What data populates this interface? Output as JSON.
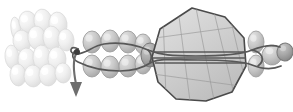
{
  "figure": {
    "domain": "Diagram",
    "caption": "",
    "width": 293,
    "height": 112,
    "background_color": "#ffffff",
    "style": {
      "rendering": "grayscale shaded 3D illustration",
      "outline_color": "#4a4a4a",
      "strand_color": "#585858",
      "arrow_color": "#6e6e6e",
      "node_color": "#3d3d3d",
      "hatch_color": "#9a9a9a"
    },
    "palette": {
      "bead_pale_fill": "#ededed",
      "bead_pale_edge": "#d8d8d8",
      "bead_mid_fill": "#c6c6c6",
      "bead_mid_edge": "#9d9d9d",
      "bead_dark_fill": "#a8a8a8",
      "bead_dark_edge": "#7a7a7a",
      "capsid_fill": "#cfcfcf",
      "capsid_fill_light": "#dedede",
      "capsid_edge": "#4a4a4a"
    }
  },
  "regions": {
    "left_cluster": {
      "label": "condensed nucleoprotein array",
      "description": "dense stack of pale ellipsoid subunits in two staggered rows",
      "bead_count": 16,
      "shade": "pale"
    },
    "filament": {
      "label": "beads-on-a-string filament",
      "description": "two parallel rows of mid-gray ellipsoid beads threaded by a duplex strand",
      "top_row_beads": 4,
      "bottom_row_beads": 4,
      "shade": "mid"
    },
    "portal": {
      "label": "portal subunit",
      "description": "single darker ellipsoid at the capsid entry point",
      "bead_count": 1,
      "shade": "dark"
    },
    "capsid": {
      "label": "icosahedral capsid",
      "description": "large polygonal shell with hatched facets and equatorial banding",
      "facet_sides": 10,
      "shade": "light"
    },
    "right_cluster": {
      "label": "distal subunit cluster",
      "description": "small group of ellipsoids encircled by the emerging strand",
      "bead_count": 4,
      "shade": "mid"
    },
    "arrow": {
      "label": "packaging direction arrow",
      "description": "curved strand terminating in a downward arrowhead",
      "direction": "down"
    },
    "node": {
      "label": "strand junction node",
      "description": "small dark dot where the strand loops back on itself"
    }
  },
  "geometry": {
    "left_cluster_beads": [
      {
        "cx": 16,
        "cy": 29,
        "rx": 5,
        "ry": 12,
        "rot": -8,
        "tone": "pale",
        "z": 0
      },
      {
        "cx": 28,
        "cy": 22,
        "rx": 9,
        "ry": 11,
        "rot": -12,
        "tone": "pale",
        "z": 1
      },
      {
        "cx": 43,
        "cy": 21,
        "rx": 9,
        "ry": 12,
        "rot": -10,
        "tone": "pale",
        "z": 1
      },
      {
        "cx": 58,
        "cy": 24,
        "rx": 9,
        "ry": 12,
        "rot": -8,
        "tone": "pale",
        "z": 1
      },
      {
        "cx": 22,
        "cy": 41,
        "rx": 9,
        "ry": 11,
        "rot": -10,
        "tone": "pale",
        "z": 0
      },
      {
        "cx": 37,
        "cy": 38,
        "rx": 9,
        "ry": 12,
        "rot": -10,
        "tone": "pale",
        "z": 1
      },
      {
        "cx": 52,
        "cy": 38,
        "rx": 9,
        "ry": 12,
        "rot": -8,
        "tone": "pale",
        "z": 1
      },
      {
        "cx": 66,
        "cy": 40,
        "rx": 8,
        "ry": 11,
        "rot": -6,
        "tone": "pale",
        "z": 1
      },
      {
        "cx": 12,
        "cy": 57,
        "rx": 7,
        "ry": 12,
        "rot": -6,
        "tone": "pale",
        "z": 0
      },
      {
        "cx": 27,
        "cy": 60,
        "rx": 9,
        "ry": 12,
        "rot": -6,
        "tone": "pale",
        "z": 1
      },
      {
        "cx": 42,
        "cy": 58,
        "rx": 9,
        "ry": 13,
        "rot": -6,
        "tone": "pale",
        "z": 1
      },
      {
        "cx": 57,
        "cy": 59,
        "rx": 9,
        "ry": 12,
        "rot": -4,
        "tone": "pale",
        "z": 1
      },
      {
        "cx": 18,
        "cy": 75,
        "rx": 8,
        "ry": 11,
        "rot": -4,
        "tone": "pale",
        "z": 0
      },
      {
        "cx": 33,
        "cy": 76,
        "rx": 9,
        "ry": 11,
        "rot": -4,
        "tone": "pale",
        "z": 1
      },
      {
        "cx": 48,
        "cy": 75,
        "rx": 9,
        "ry": 11,
        "rot": -4,
        "tone": "pale",
        "z": 1
      },
      {
        "cx": 63,
        "cy": 73,
        "rx": 8,
        "ry": 10,
        "rot": -4,
        "tone": "pale",
        "z": 1
      }
    ],
    "filament_top_beads": [
      {
        "cx": 92,
        "cy": 42,
        "rx": 9,
        "ry": 11,
        "rot": 0,
        "tone": "mid"
      },
      {
        "cx": 110,
        "cy": 41,
        "rx": 9,
        "ry": 11,
        "rot": 0,
        "tone": "mid"
      },
      {
        "cx": 128,
        "cy": 42,
        "rx": 9,
        "ry": 11,
        "rot": 0,
        "tone": "mid"
      },
      {
        "cx": 143,
        "cy": 44,
        "rx": 8,
        "ry": 10,
        "rot": 0,
        "tone": "mid"
      }
    ],
    "filament_bottom_beads": [
      {
        "cx": 92,
        "cy": 66,
        "rx": 9,
        "ry": 11,
        "rot": 0,
        "tone": "mid"
      },
      {
        "cx": 110,
        "cy": 67,
        "rx": 9,
        "ry": 11,
        "rot": 0,
        "tone": "mid"
      },
      {
        "cx": 128,
        "cy": 66,
        "rx": 9,
        "ry": 11,
        "rot": 0,
        "tone": "mid"
      },
      {
        "cx": 143,
        "cy": 64,
        "rx": 8,
        "ry": 10,
        "rot": 0,
        "tone": "mid"
      }
    ],
    "portal_bead": {
      "cx": 150,
      "cy": 55,
      "rx": 9,
      "ry": 12,
      "rot": 0,
      "tone": "dark"
    },
    "capsid_polygon": "192,8 225,17 244,38 246,66 232,92 206,101 176,99 158,82 152,57 160,29",
    "capsid_bands": [
      {
        "x1": 152,
        "y1": 52,
        "x2": 247,
        "y2": 52
      },
      {
        "x1": 152,
        "y1": 58,
        "x2": 247,
        "y2": 58
      },
      {
        "x1": 155,
        "y1": 63,
        "x2": 249,
        "y2": 63
      }
    ],
    "capsid_hatches": [
      {
        "x1": 163,
        "y1": 14,
        "x2": 166,
        "y2": 98
      },
      {
        "x1": 178,
        "y1": 9,
        "x2": 190,
        "y2": 101
      },
      {
        "x1": 196,
        "y1": 8,
        "x2": 214,
        "y2": 100
      },
      {
        "x1": 214,
        "y1": 12,
        "x2": 234,
        "y2": 94
      },
      {
        "x1": 231,
        "y1": 21,
        "x2": 245,
        "y2": 80
      },
      {
        "x1": 155,
        "y1": 38,
        "x2": 243,
        "y2": 26
      },
      {
        "x1": 153,
        "y1": 74,
        "x2": 240,
        "y2": 86
      }
    ],
    "right_cluster_beads": [
      {
        "cx": 256,
        "cy": 42,
        "rx": 8,
        "ry": 11,
        "rot": 0,
        "tone": "mid"
      },
      {
        "cx": 256,
        "cy": 66,
        "rx": 8,
        "ry": 11,
        "rot": 0,
        "tone": "mid"
      },
      {
        "cx": 272,
        "cy": 55,
        "rx": 10,
        "ry": 10,
        "rot": 10,
        "tone": "mid"
      },
      {
        "cx": 285,
        "cy": 52,
        "rx": 8,
        "ry": 9,
        "rot": 10,
        "tone": "dark"
      }
    ],
    "strand_paths": [
      "M 78 49 C 70 44, 68 54, 76 54 C 86 54, 92 46, 104 44 C 118 42, 134 44, 148 50 C 160 55, 172 56, 196 56 C 222 56, 240 55, 252 50 C 262 46, 272 44, 280 47",
      "M 78 49 C 72 52, 70 58, 78 62 C 90 68, 104 71, 120 71 C 134 71, 146 66, 152 62 C 162 58, 174 60, 198 60 C 224 60, 242 61, 252 65 C 262 69, 272 70, 281 66",
      "M 252 50 C 262 52, 266 60, 258 66",
      "M 148 50 C 152 54, 152 58, 150 62"
    ],
    "arrow_path": "M 76 54 C 72 62, 74 74, 76 84",
    "arrow_head": "70,82 82,82 76,97",
    "node_dot": {
      "cx": 77,
      "cy": 52,
      "r": 3
    }
  }
}
